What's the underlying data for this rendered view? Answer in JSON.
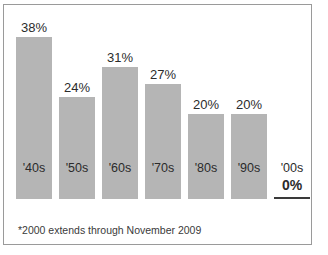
{
  "chart_data": {
    "type": "bar",
    "title": "",
    "xlabel": "",
    "ylabel": "",
    "ylim": [
      0,
      40
    ],
    "grid": false,
    "legend": "none",
    "categories": [
      "'40s",
      "'50s",
      "'60s",
      "'70s",
      "'80s",
      "'90s",
      "'00s"
    ],
    "values": [
      38,
      24,
      31,
      27,
      20,
      20,
      0
    ],
    "value_labels": [
      "38%",
      "24%",
      "31%",
      "27%",
      "20%",
      "20%",
      "0%"
    ],
    "bar_color": "#b5b5b5",
    "text_color": "#2b2b2b",
    "border_color": "#9a9a9a",
    "background_color": "#ffffff",
    "annotations": {
      "footnote": "*2000 extends through November 2009"
    }
  },
  "chart": {
    "title_sliver": "",
    "footnote": "*2000 extends through November 2009",
    "bars": [
      {
        "category": "'40s",
        "label": "38%",
        "value": 38,
        "zero": false
      },
      {
        "category": "'50s",
        "label": "24%",
        "value": 24,
        "zero": false
      },
      {
        "category": "'60s",
        "label": "31%",
        "value": 31,
        "zero": false
      },
      {
        "category": "'70s",
        "label": "27%",
        "value": 27,
        "zero": false
      },
      {
        "category": "'80s",
        "label": "20%",
        "value": 20,
        "zero": false
      },
      {
        "category": "'90s",
        "label": "20%",
        "value": 20,
        "zero": false
      },
      {
        "category": "'00s",
        "label": "0%",
        "value": 0,
        "zero": true
      }
    ]
  }
}
